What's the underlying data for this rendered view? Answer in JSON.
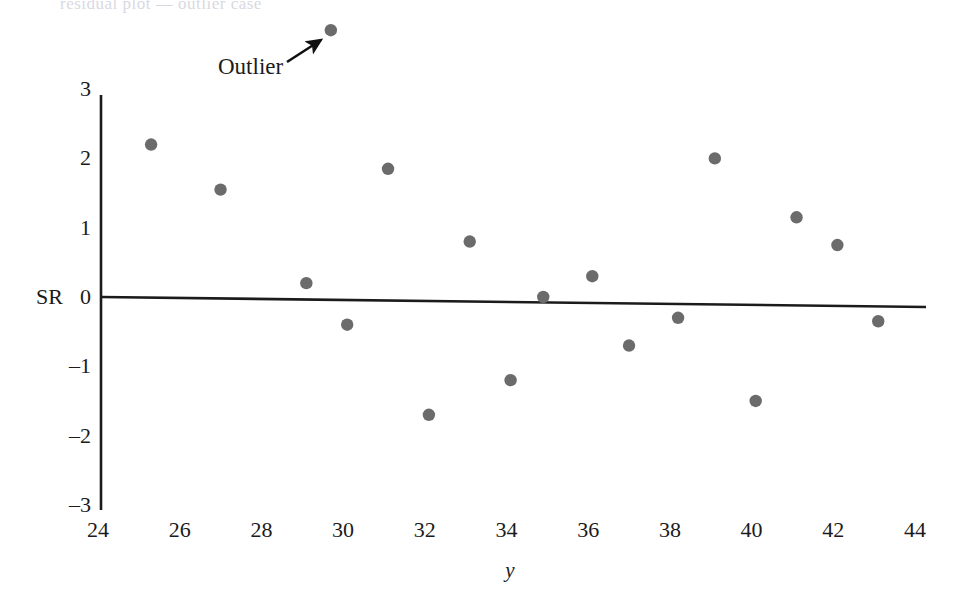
{
  "figure": {
    "background_color": "#ffffff",
    "ink_color": "#1b1b1b",
    "point_color": "#6b6b6b",
    "bleed_through_text": "residual plot — outlier case"
  },
  "annotations": [
    {
      "name": "outlier-annotation",
      "text": "Outlier",
      "text_x": 218,
      "text_y": 66,
      "arrow_from_x": 287,
      "arrow_from_y": 62,
      "arrow_to_x": 321,
      "arrow_to_y": 40
    }
  ],
  "axes": {
    "y_axis_label": "SR",
    "x_axis_label": "y",
    "y_ticks": [
      "3",
      "2",
      "1",
      "0",
      "-1",
      "-2",
      "-3"
    ],
    "y_tick_values": [
      3,
      2,
      1,
      0,
      -1,
      -2,
      -3
    ],
    "x_ticks": [
      "24",
      "26",
      "28",
      "30",
      "32",
      "34",
      "36",
      "38",
      "40",
      "42",
      "44"
    ],
    "x_tick_values": [
      24,
      26,
      28,
      30,
      32,
      34,
      36,
      38,
      40,
      42,
      44
    ]
  },
  "chart_data": {
    "type": "scatter",
    "title": "",
    "xlabel": "y",
    "ylabel": "SR",
    "xlim": [
      24,
      44
    ],
    "ylim": [
      -3,
      3
    ],
    "grid": false,
    "legend": "none",
    "zero_line": true,
    "annotations": [
      "Outlier"
    ],
    "x": [
      25.3,
      27.0,
      29.1,
      29.7,
      30.1,
      31.1,
      32.1,
      33.1,
      34.1,
      34.9,
      36.1,
      37.0,
      38.2,
      39.1,
      40.1,
      41.1,
      42.1,
      43.1
    ],
    "y": [
      2.2,
      1.55,
      0.2,
      3.85,
      -0.4,
      1.85,
      -1.7,
      0.8,
      -1.2,
      0.0,
      0.3,
      -0.7,
      -0.3,
      2.0,
      -1.5,
      1.15,
      0.75,
      -0.35
    ],
    "points": [
      {
        "x": 25.3,
        "y": 2.2,
        "label": ""
      },
      {
        "x": 27.0,
        "y": 1.55,
        "label": ""
      },
      {
        "x": 29.1,
        "y": 0.2,
        "label": ""
      },
      {
        "x": 29.7,
        "y": 3.85,
        "label": "Outlier"
      },
      {
        "x": 30.1,
        "y": -0.4,
        "label": ""
      },
      {
        "x": 31.1,
        "y": 1.85,
        "label": ""
      },
      {
        "x": 32.1,
        "y": -1.7,
        "label": ""
      },
      {
        "x": 33.1,
        "y": 0.8,
        "label": ""
      },
      {
        "x": 34.1,
        "y": -1.2,
        "label": ""
      },
      {
        "x": 34.9,
        "y": 0.0,
        "label": ""
      },
      {
        "x": 36.1,
        "y": 0.3,
        "label": ""
      },
      {
        "x": 37.0,
        "y": -0.7,
        "label": ""
      },
      {
        "x": 38.2,
        "y": -0.3,
        "label": ""
      },
      {
        "x": 39.1,
        "y": 2.0,
        "label": ""
      },
      {
        "x": 40.1,
        "y": -1.5,
        "label": ""
      },
      {
        "x": 41.1,
        "y": 1.15,
        "label": ""
      },
      {
        "x": 42.1,
        "y": 0.75,
        "label": ""
      },
      {
        "x": 43.1,
        "y": -0.35,
        "label": ""
      }
    ]
  }
}
